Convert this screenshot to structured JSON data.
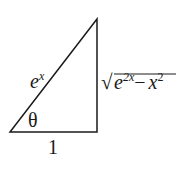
{
  "diagram": {
    "type": "right-triangle",
    "labels": {
      "hypotenuse": {
        "base": "e",
        "sup": "x"
      },
      "opposite": {
        "radical_base1": "e",
        "radical_sup1": "2x",
        "minus": "−",
        "radical_base2": "x",
        "radical_sup2": "2"
      },
      "adjacent": "1",
      "angle": "θ"
    },
    "stroke_color": "#1a1a1a"
  }
}
